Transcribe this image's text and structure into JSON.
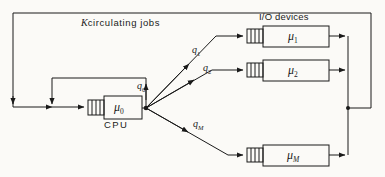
{
  "figure": {
    "kind": "queueing-network-diagram",
    "background_color": "#fbfaf7",
    "line_color": "#1a1a1a",
    "annotations": {
      "circulating_jobs_symbol": "K",
      "circulating_jobs_text": "circulating jobs",
      "io_devices_label": "I/O devices",
      "cpu_label": "CPU"
    },
    "nodes": [
      {
        "id": "cpu",
        "server_symbol": "μ",
        "server_subscript": "0",
        "caption": "CPU"
      },
      {
        "id": "io1",
        "server_symbol": "μ",
        "server_subscript": "1",
        "caption": ""
      },
      {
        "id": "io2",
        "server_symbol": "μ",
        "server_subscript": "2",
        "caption": ""
      },
      {
        "id": "ioM",
        "server_symbol": "μ",
        "server_subscript": "M",
        "caption": ""
      }
    ],
    "branch_labels": [
      {
        "id": "q0",
        "symbol": "q",
        "subscript": "0",
        "subscript_italic": false
      },
      {
        "id": "q1",
        "symbol": "q",
        "subscript": "1",
        "subscript_italic": false
      },
      {
        "id": "q2",
        "symbol": "q",
        "subscript": "2",
        "subscript_italic": false
      },
      {
        "id": "qM",
        "symbol": "q",
        "subscript": "M",
        "subscript_italic": true
      }
    ]
  }
}
